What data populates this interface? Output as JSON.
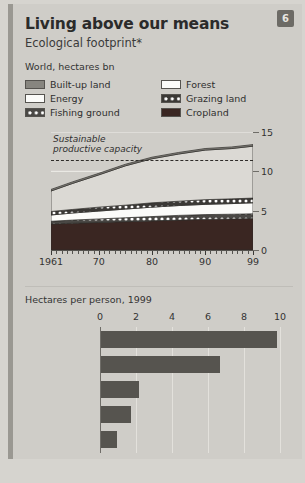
{
  "header": {
    "title": "Living above our means",
    "subtitle": "Ecological footprint*",
    "badge": "6"
  },
  "area_chart": {
    "units": "World, hectares bn",
    "annotation_line1": "Sustainable",
    "annotation_line2": "productive capacity",
    "legend": [
      {
        "label": "Built-up land",
        "swatch": "built-up-land-swatch"
      },
      {
        "label": "Forest",
        "swatch": "forest-swatch"
      },
      {
        "label": "Energy",
        "swatch": "energy-swatch"
      },
      {
        "label": "Grazing land",
        "swatch": "grazing-land-swatch"
      },
      {
        "label": "Fishing ground",
        "swatch": "fishing-ground-swatch"
      },
      {
        "label": "Cropland",
        "swatch": "cropland-swatch"
      }
    ]
  },
  "bar_chart": {
    "units": "Hectares per person, 1999"
  },
  "footnote": "",
  "chart_data": [
    {
      "type": "area",
      "title": "Living above our means",
      "subtitle": "Ecological footprint*",
      "ylabel": "World, hectares bn",
      "xlabel": "",
      "stacked": true,
      "grid": true,
      "legend_position": "top",
      "ylim": [
        0,
        15
      ],
      "yticks": [
        0,
        5,
        10,
        15
      ],
      "xlim": [
        1961,
        1999
      ],
      "xticks": [
        1961,
        1970,
        1980,
        1990,
        1999
      ],
      "xticklabels": [
        "1961",
        "70",
        "80",
        "90",
        "99"
      ],
      "x": [
        1961,
        1965,
        1970,
        1975,
        1980,
        1985,
        1990,
        1995,
        1999
      ],
      "series": [
        {
          "name": "Cropland",
          "values": [
            3.3,
            3.4,
            3.5,
            3.6,
            3.7,
            3.8,
            3.9,
            3.95,
            4.0
          ]
        },
        {
          "name": "Fishing ground",
          "values": [
            0.35,
            0.4,
            0.45,
            0.5,
            0.55,
            0.6,
            0.6,
            0.6,
            0.6
          ]
        },
        {
          "name": "Energy",
          "values": [
            0.8,
            0.9,
            1.0,
            1.1,
            1.2,
            1.25,
            1.3,
            1.35,
            1.4
          ]
        },
        {
          "name": "Grazing land",
          "values": [
            0.45,
            0.45,
            0.5,
            0.5,
            0.55,
            0.55,
            0.6,
            0.6,
            0.6
          ]
        },
        {
          "name": "Forest",
          "values": [
            2.6,
            3.3,
            4.1,
            5.0,
            5.6,
            6.0,
            6.3,
            6.4,
            6.6
          ]
        },
        {
          "name": "Built-up land",
          "values": [
            0.2,
            0.2,
            0.2,
            0.2,
            0.2,
            0.2,
            0.2,
            0.2,
            0.2
          ]
        }
      ],
      "totals": [
        7.7,
        8.65,
        9.75,
        10.9,
        11.8,
        12.4,
        12.9,
        13.1,
        13.4
      ],
      "annotations": [
        {
          "text": "Sustainable productive capacity",
          "type": "dashed-line",
          "y": 11.4
        }
      ]
    },
    {
      "type": "bar",
      "orientation": "horizontal",
      "title": "Hectares per person, 1999",
      "xlabel": "",
      "ylabel": "",
      "grid": true,
      "xlim": [
        0,
        10
      ],
      "xticks": [
        0,
        2,
        4,
        6,
        8,
        10
      ],
      "xticklabels": [
        "0",
        "2",
        "4",
        "6",
        "8",
        "10"
      ],
      "categories": [
        "United States",
        "High-income countries",
        "Middle-income countries",
        "China",
        "Low-income countries"
      ],
      "category_lines": [
        [
          "United States"
        ],
        [
          "High-income",
          "countries"
        ],
        [
          "Middle-income",
          "countries"
        ],
        [
          "China"
        ],
        [
          "Low-income",
          "countries"
        ]
      ],
      "values": [
        9.8,
        6.6,
        2.1,
        1.65,
        0.9
      ]
    }
  ]
}
